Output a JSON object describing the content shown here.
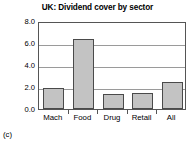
{
  "caption": "(c)",
  "chart_data": {
    "type": "bar",
    "title": "UK: Dividend cover by sector",
    "xlabel": "",
    "ylabel": "",
    "categories": [
      "Mach",
      "Food",
      "Drug",
      "Retail",
      "All"
    ],
    "values": [
      1.9,
      6.35,
      1.4,
      1.45,
      2.5
    ],
    "ylim": [
      0.0,
      8.0
    ],
    "yticks": [
      0.0,
      2.0,
      4.0,
      6.0,
      8.0
    ],
    "ytick_labels": [
      "0.0",
      "2.0",
      "4.0",
      "6.0",
      "8.0"
    ],
    "grid": true,
    "legend": false,
    "legend_position": "none",
    "bar_fill_color": "#c3c3c3",
    "bar_edge_color": "#4a4a4a",
    "gridline_color": "#9a9a9a",
    "axis_color": "#555555",
    "background_color": "#ffffff"
  }
}
